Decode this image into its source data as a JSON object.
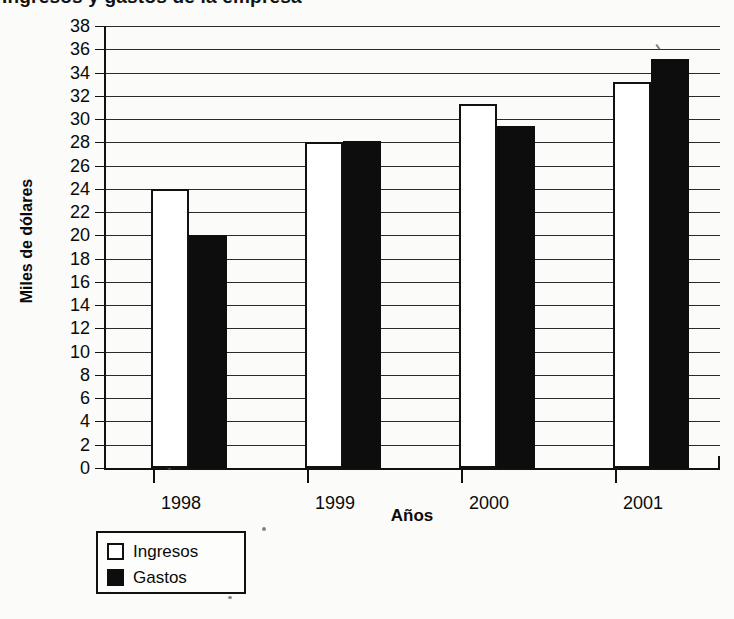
{
  "chart_data": {
    "type": "bar",
    "title": "Ingresos y gastos de la empresa",
    "xlabel": "Años",
    "ylabel": "Miles de dólares",
    "categories": [
      "1998",
      "1999",
      "2000",
      "2001"
    ],
    "series": [
      {
        "name": "Ingresos",
        "values": [
          24.0,
          28.0,
          31.3,
          33.2
        ],
        "color": "#ffffff"
      },
      {
        "name": "Gastos",
        "values": [
          20.0,
          28.1,
          29.4,
          35.2
        ],
        "color": "#0d0d0d"
      }
    ],
    "ylim": [
      0,
      38
    ],
    "ytick_step": 2,
    "yticks": [
      0,
      2,
      4,
      6,
      8,
      10,
      12,
      14,
      16,
      18,
      20,
      22,
      24,
      26,
      28,
      30,
      32,
      34,
      36,
      38
    ],
    "grid": true,
    "legend_position": "below-left",
    "legend": [
      {
        "label": "Ingresos",
        "swatch": "white-square"
      },
      {
        "label": "Gastos",
        "swatch": "black-square"
      }
    ]
  },
  "colors": {
    "ink": "#111111",
    "paper": "#fbfbf9",
    "series_ingresos": "#ffffff",
    "series_gastos": "#0d0d0d"
  }
}
